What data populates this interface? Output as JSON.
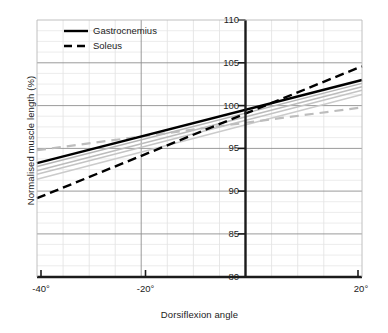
{
  "chart_data": {
    "type": "line",
    "title": "",
    "xlabel": "Dorsiflexion angle",
    "ylabel": "Normalised muscle length (%)",
    "xlim": [
      -40,
      20
    ],
    "ylim": [
      80,
      110
    ],
    "xticks": [
      -40,
      -20,
      20
    ],
    "xtick_labels": [
      "-40°",
      "-20°",
      "20°"
    ],
    "yticks": [
      80,
      85,
      90,
      95,
      100,
      105,
      110
    ],
    "ytick_labels": [
      "80",
      "85",
      "90",
      "95",
      "100",
      "105",
      "110"
    ],
    "grid": "major and minor gridlines, minor every 5° in x and 1.25% in y",
    "legend_position": "top-left inside plot",
    "x": [
      -40,
      20
    ],
    "series": [
      {
        "name": "Gastrocnemius",
        "style": "solid",
        "color": "#000000",
        "emphasis": true,
        "values": [
          93.3,
          103.0
        ]
      },
      {
        "name": "Soleus",
        "style": "dashed",
        "color": "#000000",
        "emphasis": true,
        "values": [
          89.2,
          104.6
        ]
      },
      {
        "name": "unlabelled-grey-1",
        "style": "solid",
        "color": "#b5b5b5",
        "emphasis": false,
        "values": [
          92.9,
          102.6
        ]
      },
      {
        "name": "unlabelled-grey-2",
        "style": "solid",
        "color": "#bcbcbc",
        "emphasis": false,
        "values": [
          92.4,
          102.2
        ]
      },
      {
        "name": "unlabelled-grey-3",
        "style": "solid",
        "color": "#c4c4c4",
        "emphasis": false,
        "values": [
          92.0,
          101.8
        ]
      },
      {
        "name": "unlabelled-grey-4",
        "style": "solid",
        "color": "#cbcbcb",
        "emphasis": false,
        "values": [
          91.4,
          101.3
        ]
      },
      {
        "name": "unlabelled-grey-dashed",
        "style": "dashed",
        "color": "#bdbdbd",
        "emphasis": false,
        "values": [
          94.8,
          99.8
        ]
      }
    ]
  },
  "legend": {
    "items": [
      {
        "label": "Gastrocnemius",
        "style": "solid"
      },
      {
        "label": "Soleus",
        "style": "dashed"
      }
    ]
  },
  "axes": {
    "x_title": "Dorsiflexion angle",
    "y_title": "Normalised muscle length (%)",
    "x_tick_labels": [
      "-40°",
      "-20°",
      "20°"
    ],
    "y_tick_labels": [
      "110",
      "105",
      "100",
      "95",
      "90",
      "85",
      "80"
    ]
  },
  "colors": {
    "axis": "#1b1b1b",
    "major_grid": "#8c8c8c",
    "minor_grid": "#d8d8d8",
    "emphasis_line": "#000000",
    "faint_line": "#c0c0c0",
    "background": "#ffffff"
  }
}
